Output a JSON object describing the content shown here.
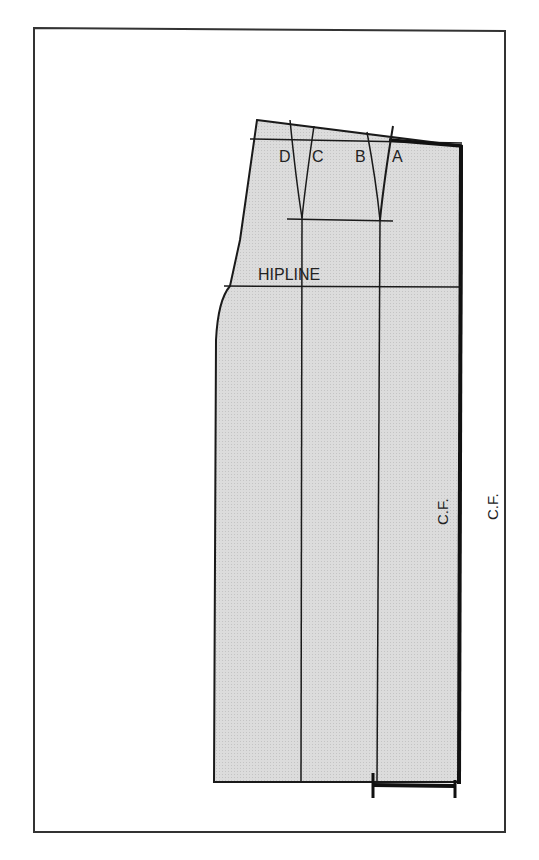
{
  "diagram": {
    "type": "sewing-pattern",
    "labels": {
      "dart_points": [
        "D",
        "C",
        "B",
        "A"
      ],
      "hipline": "HIPLINE",
      "center_front_inner": "C.F.",
      "center_front_outer": "C.F."
    },
    "colors": {
      "fill": "#d9d9d9",
      "line": "#1a1a1a",
      "frame": "#333333",
      "background": "#ffffff"
    }
  }
}
